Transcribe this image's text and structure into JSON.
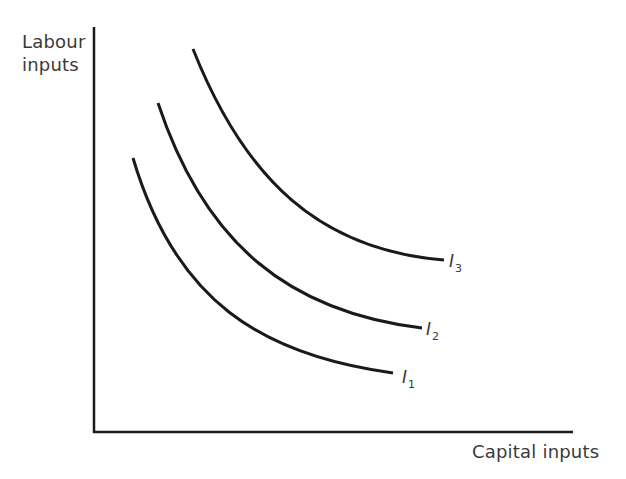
{
  "diagram": {
    "type": "isoquant-map",
    "y_axis_label_line1": "Labour",
    "y_axis_label_line2": "inputs",
    "x_axis_label": "Capital inputs",
    "axes": {
      "origin": [
        94,
        432
      ],
      "y_top": [
        94,
        27
      ],
      "x_end": [
        573,
        432
      ],
      "color": "#1a1a1a"
    },
    "curves": [
      {
        "id": "I1",
        "label": "I",
        "subscript": "1",
        "start": [
          133,
          158
        ],
        "control1": [
          175,
          300
        ],
        "control2": [
          260,
          355
        ],
        "end": [
          393,
          373
        ]
      },
      {
        "id": "I2",
        "label": "I",
        "subscript": "2",
        "start": [
          158,
          103
        ],
        "control1": [
          205,
          245
        ],
        "control2": [
          290,
          312
        ],
        "end": [
          422,
          328
        ]
      },
      {
        "id": "I3",
        "label": "I",
        "subscript": "3",
        "start": [
          193,
          49
        ],
        "control1": [
          245,
          180
        ],
        "control2": [
          320,
          250
        ],
        "end": [
          444,
          260
        ]
      }
    ],
    "stroke_color": "#1a1a1a",
    "text_color": "#3a3a3a"
  }
}
